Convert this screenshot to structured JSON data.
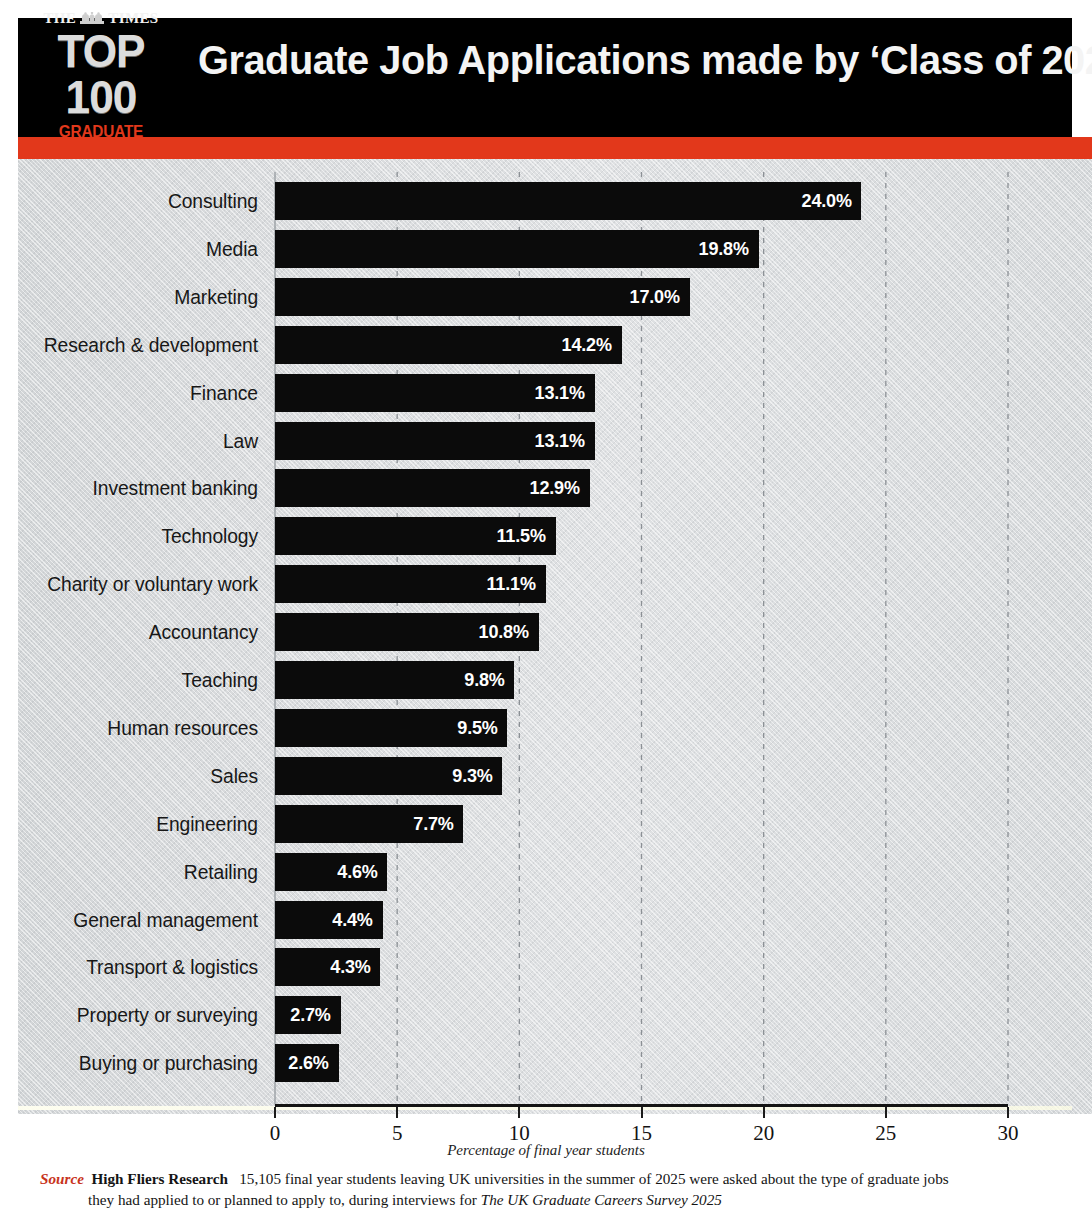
{
  "header": {
    "logo": {
      "masthead_the": "THE",
      "masthead_times": "TIMES",
      "crest_icon": "times-crest-icon",
      "top_line": "TOP 100",
      "sub_line": "GRADUATE EMPLOYERS"
    },
    "title": "Graduate Job Applications made by ‘Class of 2025’",
    "background_color": "#000000",
    "accent_color": "#e2381b",
    "title_color": "#f4f4f4"
  },
  "footer": {
    "source_label": "Source",
    "source_org": "High Fliers Research",
    "description_part1": "15,105 final year students leaving UK universities in the summer of 2025 were asked about the type of graduate jobs",
    "description_part2": "they had applied to or planned to apply to, during interviews for ",
    "survey_name": "The UK Graduate Careers Survey 2025",
    "source_label_color": "#c8341c"
  },
  "chart_data": {
    "type": "bar",
    "orientation": "horizontal",
    "title": "Graduate Job Applications made by ‘Class of 2025’",
    "xlabel": "Percentage of final year students",
    "ylabel": "",
    "xlim": [
      0,
      30
    ],
    "xticks": [
      0,
      5,
      10,
      15,
      20,
      25,
      30
    ],
    "xtick_labels": [
      "0",
      "5",
      "10",
      "15",
      "20",
      "25",
      "30"
    ],
    "grid": "vertical-dashed",
    "legend": "none",
    "value_suffix": "%",
    "bar_color": "#0b0b0b",
    "value_label_color": "#ffffff",
    "plot_background": "#d8dbdd",
    "categories": [
      "Consulting",
      "Media",
      "Marketing",
      "Research & development",
      "Finance",
      "Law",
      "Investment banking",
      "Technology",
      "Charity or voluntary work",
      "Accountancy",
      "Teaching",
      "Human resources",
      "Sales",
      "Engineering",
      "Retailing",
      "General management",
      "Transport & logistics",
      "Property or surveying",
      "Buying or purchasing"
    ],
    "values": [
      24.0,
      19.8,
      17.0,
      14.2,
      13.1,
      13.1,
      12.9,
      11.5,
      11.1,
      10.8,
      9.8,
      9.5,
      9.3,
      7.7,
      4.6,
      4.4,
      4.3,
      2.7,
      2.6
    ],
    "value_labels": [
      "24.0%",
      "19.8%",
      "17.0%",
      "14.2%",
      "13.1%",
      "13.1%",
      "12.9%",
      "11.5%",
      "11.1%",
      "10.8%",
      "9.8%",
      "9.5%",
      "9.3%",
      "7.7%",
      "4.6%",
      "4.4%",
      "4.3%",
      "2.7%",
      "2.6%"
    ]
  }
}
